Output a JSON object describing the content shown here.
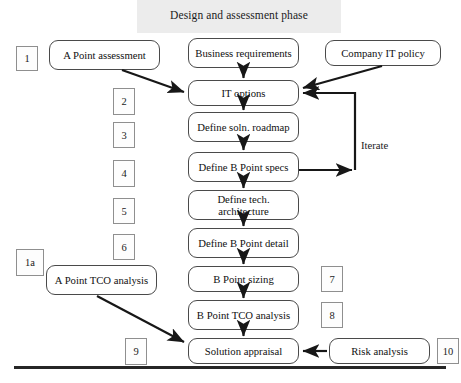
{
  "diagram": {
    "title": "Design and assessment phase",
    "type": "flowchart",
    "main_flow": [
      {
        "id": "business-requirements",
        "label": "Business requirements",
        "x": 188,
        "y": 38,
        "w": 111,
        "h": 30
      },
      {
        "id": "it-options",
        "label": "IT options",
        "x": 188,
        "y": 80,
        "w": 111,
        "h": 26
      },
      {
        "id": "define-soln-roadmap",
        "label": "Define soln. roadmap",
        "x": 188,
        "y": 112,
        "w": 111,
        "h": 30
      },
      {
        "id": "define-b-point-specs",
        "label": "Define B Point specs",
        "x": 188,
        "y": 152,
        "w": 111,
        "h": 30
      },
      {
        "id": "define-tech-architecture",
        "label": "Define tech. architecture",
        "x": 188,
        "y": 190,
        "w": 111,
        "h": 30
      },
      {
        "id": "define-b-point-detail",
        "label": "Define B Point detail",
        "x": 188,
        "y": 228,
        "w": 111,
        "h": 30
      },
      {
        "id": "b-point-sizing",
        "label": "B Point sizing",
        "x": 188,
        "y": 266,
        "w": 111,
        "h": 26
      },
      {
        "id": "b-point-tco-analysis",
        "label": "B Point TCO analysis",
        "x": 188,
        "y": 300,
        "w": 111,
        "h": 30
      },
      {
        "id": "solution-appraisal",
        "label": "Solution appraisal",
        "x": 188,
        "y": 338,
        "w": 111,
        "h": 26
      }
    ],
    "side_boxes": [
      {
        "id": "a-point-assessment",
        "label": "A Point assessment",
        "x": 49,
        "y": 40,
        "w": 111,
        "h": 30
      },
      {
        "id": "company-it-policy",
        "label": "Company IT policy",
        "x": 325,
        "y": 40,
        "w": 116,
        "h": 26
      },
      {
        "id": "a-point-tco-analysis",
        "label": "A Point TCO analysis",
        "x": 46,
        "y": 265,
        "w": 111,
        "h": 30
      },
      {
        "id": "risk-analysis",
        "label": "Risk analysis",
        "x": 329,
        "y": 338,
        "w": 101,
        "h": 26
      }
    ],
    "number_tags": [
      {
        "label": "1",
        "x": 16,
        "y": 46,
        "w": 22,
        "h": 25
      },
      {
        "label": "2",
        "x": 113,
        "y": 88,
        "w": 22,
        "h": 27
      },
      {
        "label": "3",
        "x": 113,
        "y": 122,
        "w": 22,
        "h": 26
      },
      {
        "label": "4",
        "x": 113,
        "y": 160,
        "w": 22,
        "h": 27
      },
      {
        "label": "5",
        "x": 113,
        "y": 198,
        "w": 22,
        "h": 26
      },
      {
        "label": "6",
        "x": 113,
        "y": 234,
        "w": 22,
        "h": 26
      },
      {
        "label": "1a",
        "x": 16,
        "y": 249,
        "w": 28,
        "h": 27
      },
      {
        "label": "7",
        "x": 321,
        "y": 266,
        "w": 22,
        "h": 26
      },
      {
        "label": "8",
        "x": 321,
        "y": 302,
        "w": 22,
        "h": 26
      },
      {
        "label": "9",
        "x": 125,
        "y": 338,
        "w": 22,
        "h": 27
      },
      {
        "label": "10",
        "x": 437,
        "y": 338,
        "w": 22,
        "h": 26
      }
    ],
    "labels": [
      {
        "id": "iterate-label",
        "text": "Iterate",
        "x": 361,
        "y": 139
      }
    ],
    "colors": {
      "banner": "#ececec",
      "box_border": "#4a4a4a",
      "tag_border": "#8f8f8f",
      "arrow": "#171717",
      "rule": "#262626",
      "text": "#111111"
    }
  }
}
